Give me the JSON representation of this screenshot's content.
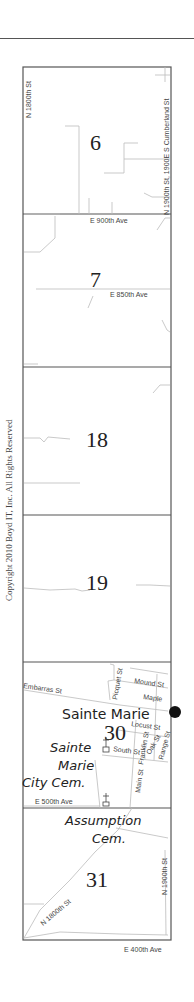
{
  "copyright": "Copyright 2010 Boyd IT, Inc. All Rights Reserved",
  "sections": [
    {
      "number": "6"
    },
    {
      "number": "7"
    },
    {
      "number": "18"
    },
    {
      "number": "19"
    },
    {
      "number": "30"
    },
    {
      "number": "31"
    }
  ],
  "roads": {
    "n1800_top": "N 1800th St",
    "east_top": "N 1900th St, 1900E S Cumberland St",
    "e900": "E 900th Ave",
    "e850": "E 850th Ave",
    "embarras": "Embarras St",
    "picquet": "Picquet St",
    "mound": "Mound St",
    "maple": "Maple",
    "locust": "Locust St",
    "franklin": "Franklin St",
    "oak": "Oak St",
    "range": "Range St",
    "south": "South St",
    "main": "Main St",
    "e500": "E 500th Ave",
    "n1800_bottom": "N 1800th St",
    "n1900_bottom": "N 1900th St",
    "e400": "E 400th Ave"
  },
  "places": {
    "town": "Sainte Marie",
    "city_cem_line1": "Sainte",
    "city_cem_line2": "Marie",
    "city_cem_line3": "City Cem.",
    "assumption_line1": "Assumption",
    "assumption_line2": "Cem."
  },
  "colors": {
    "border": "#555555",
    "road": "#bbbbbb",
    "text": "#222222"
  }
}
